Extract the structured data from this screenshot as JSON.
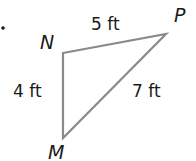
{
  "diagram": {
    "type": "triangle",
    "stroke_color": "#8a8a8a",
    "text_color": "#1a1a1a",
    "vertices": [
      {
        "name": "N",
        "x": 63,
        "y": 53
      },
      {
        "name": "P",
        "x": 166,
        "y": 34
      },
      {
        "name": "M",
        "x": 63,
        "y": 138
      }
    ],
    "sides": [
      {
        "from": "N",
        "to": "P",
        "label": "5 ft"
      },
      {
        "from": "N",
        "to": "M",
        "label": "4 ft"
      },
      {
        "from": "M",
        "to": "P",
        "label": "7 ft"
      }
    ]
  }
}
